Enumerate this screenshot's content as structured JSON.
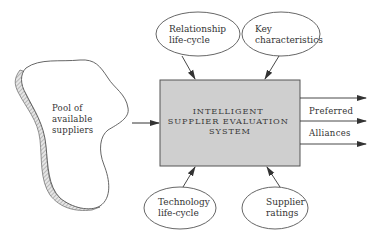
{
  "diagram": {
    "central_system": {
      "lines": [
        "INTELLIGENT",
        "SUPPLIER EVALUATION",
        "SYSTEM"
      ],
      "fill_color": "#cfcfcf"
    },
    "pool": {
      "lines": [
        "Pool of",
        "available",
        "suppliers"
      ]
    },
    "inputs_top": [
      {
        "lines": [
          "Relationship",
          "life-cycle"
        ]
      },
      {
        "lines": [
          "Key",
          "characteristics"
        ]
      }
    ],
    "inputs_bottom": [
      {
        "lines": [
          "Technology",
          "life-cycle"
        ]
      },
      {
        "lines": [
          "Supplier",
          "ratings"
        ]
      }
    ],
    "outputs": {
      "labels": [
        "Preferred",
        "Alliances"
      ],
      "arrow_count": 3
    }
  }
}
